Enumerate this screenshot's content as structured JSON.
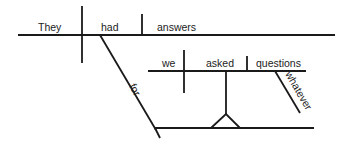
{
  "diagram": {
    "type": "sentence-diagram",
    "words": {
      "subject": "They",
      "verb": "had",
      "direct_object": "answers",
      "preposition": "for",
      "clause_subject": "we",
      "clause_verb": "asked",
      "clause_object": "questions",
      "clause_modifier": "whatever"
    },
    "colors": {
      "line": "#1a1a1a",
      "text": "#222222",
      "background": "#ffffff"
    }
  }
}
